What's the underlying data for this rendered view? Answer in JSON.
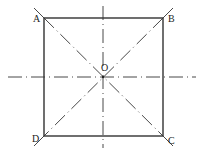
{
  "diagram": {
    "type": "geometry-square-with-symmetry-axes",
    "square": {
      "x1": 44,
      "y1": 18,
      "x2": 163,
      "y2": 136,
      "stroke": "#222222"
    },
    "center": {
      "label": "O",
      "x": 103,
      "y": 77
    },
    "vertices": [
      {
        "label": "A",
        "x": 44,
        "y": 18
      },
      {
        "label": "B",
        "x": 163,
        "y": 18
      },
      {
        "label": "C",
        "x": 163,
        "y": 136
      },
      {
        "label": "D",
        "x": 44,
        "y": 136
      }
    ],
    "axes": [
      {
        "name": "horizontal-axis",
        "style": "dash-dot"
      },
      {
        "name": "vertical-axis",
        "style": "dash-dot"
      },
      {
        "name": "diagonal-AC",
        "style": "dash-dot"
      },
      {
        "name": "diagonal-BD",
        "style": "dash-dot"
      }
    ]
  }
}
